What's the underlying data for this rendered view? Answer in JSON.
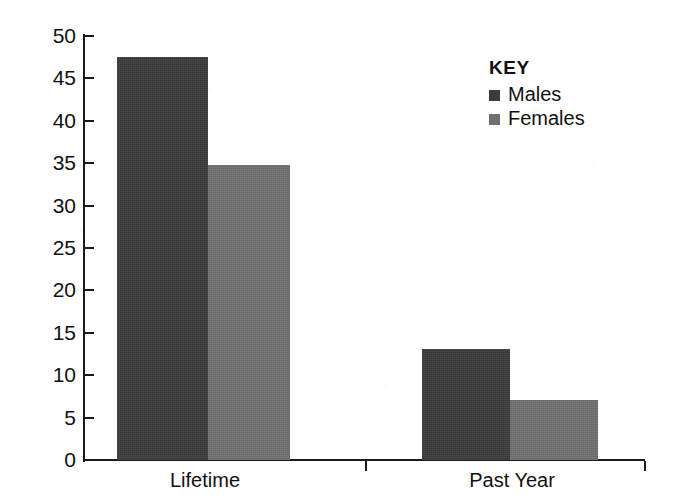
{
  "chart_data": {
    "type": "bar",
    "title": "",
    "xlabel": "",
    "ylabel": "",
    "categories": [
      "Lifetime",
      "Past Year"
    ],
    "series": [
      {
        "name": "Males",
        "color": "#3b3b3b",
        "values": [
          47.5,
          13.1
        ]
      },
      {
        "name": "Females",
        "color": "#6f6f6f",
        "values": [
          34.8,
          7.1
        ]
      }
    ],
    "ylim": [
      0,
      50
    ],
    "ytick_step": 5,
    "ytick_labels": [
      "50",
      "45",
      "40",
      "35",
      "30",
      "25",
      "20",
      "15",
      "10",
      "5",
      "0"
    ],
    "grid": false,
    "legend_position": "top-right"
  },
  "legend": {
    "title": "KEY",
    "entries": [
      {
        "label": "Males",
        "color": "#3b3b3b"
      },
      {
        "label": "Females",
        "color": "#6f6f6f"
      }
    ]
  },
  "axis": {
    "x_categories": [
      "Lifetime",
      "Past Year"
    ]
  }
}
